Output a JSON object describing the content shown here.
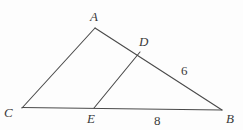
{
  "figure": {
    "kind": "geometry-diagram",
    "background_color": "#fdfdfd",
    "stroke_color": "#4a4a4a",
    "text_color": "#3a3a3a",
    "vertices": [
      {
        "name": "A",
        "label": "A",
        "x": 95,
        "y": 28
      },
      {
        "name": "B",
        "label": "B",
        "x": 222,
        "y": 110
      },
      {
        "name": "C",
        "label": "C",
        "x": 22,
        "y": 108
      },
      {
        "name": "D",
        "label": "D",
        "x": 140,
        "y": 52
      },
      {
        "name": "E",
        "label": "E",
        "x": 94,
        "y": 108
      }
    ],
    "segments": [
      {
        "name": "segment-CA",
        "from": "C",
        "to": "A"
      },
      {
        "name": "segment-AB",
        "from": "A",
        "to": "B"
      },
      {
        "name": "segment-CB",
        "from": "C",
        "to": "B"
      },
      {
        "name": "segment-DE",
        "from": "D",
        "to": "E"
      }
    ],
    "measures": [
      {
        "name": "measure-DB",
        "value": "6",
        "segment": "D-B"
      },
      {
        "name": "measure-EB",
        "value": "8",
        "segment": "E-B"
      }
    ]
  }
}
